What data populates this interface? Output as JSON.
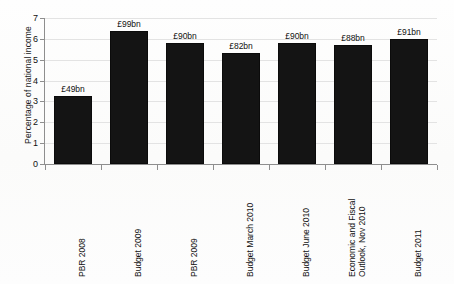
{
  "chart_data": {
    "type": "bar",
    "title": "",
    "xlabel": "",
    "ylabel": "Percentage of national income",
    "ylim": [
      0,
      7
    ],
    "yticks": [
      0,
      1,
      2,
      3,
      4,
      5,
      6,
      7
    ],
    "ytick_labels": [
      "0",
      "1",
      "2",
      "3",
      "4",
      "5",
      "6",
      "7"
    ],
    "grid": true,
    "legend": "none",
    "bar_color": "#141414",
    "categories": [
      "PBR 2008",
      "Budget 2009",
      "PBR 2009",
      "Budget March 2010",
      "Budget June 2010",
      "Economic and Fiscal Outlook, Nov 2010",
      "Budget 2011"
    ],
    "category_lines": [
      [
        "PBR 2008"
      ],
      [
        "Budget 2009"
      ],
      [
        "PBR 2009"
      ],
      [
        "Budget March 2010"
      ],
      [
        "Budget June 2010"
      ],
      [
        "Economic and Fiscal",
        "Outlook, Nov 2010"
      ],
      [
        "Budget 2011"
      ]
    ],
    "values": [
      3.25,
      6.4,
      5.8,
      5.3,
      5.8,
      5.7,
      6.0
    ],
    "data_labels": [
      "£49bn",
      "£99bn",
      "£90bn",
      "£82bn",
      "£90bn",
      "£88bn",
      "£91bn"
    ]
  }
}
